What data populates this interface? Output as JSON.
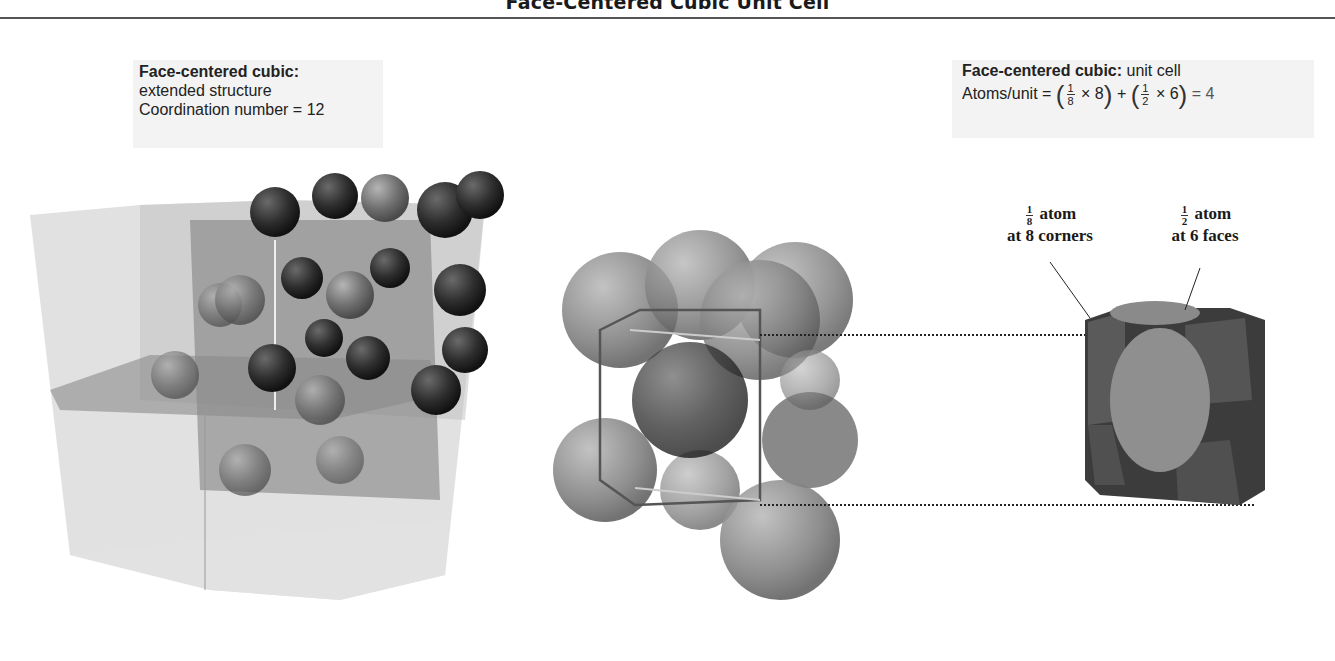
{
  "title": "Face-Centered Cubic Unit Cell",
  "left_caption": {
    "heading": "Face-centered cubic:",
    "line1": "extended structure",
    "line2": "Coordination number = 12"
  },
  "right_caption": {
    "heading": "Face-centered cubic:",
    "heading_suffix": " unit cell",
    "formula_prefix": "Atoms/unit = ",
    "frac1_num": "1",
    "frac1_den": "8",
    "times1": " × 8",
    "plus": " + ",
    "frac2_num": "1",
    "frac2_den": "2",
    "times2": " × 6",
    "result": " = 4"
  },
  "labels": {
    "corner": {
      "frac_num": "1",
      "frac_den": "8",
      "word": "atom",
      "line2": "at 8 corners"
    },
    "face": {
      "frac_num": "1",
      "frac_den": "2",
      "word": "atom",
      "line2": "at 6 faces"
    }
  },
  "colors": {
    "background": "#ffffff",
    "caption_bg": "#f3f3f3",
    "sphere_dark": "#2b2b2b",
    "sphere_mid": "#6e6e6e",
    "cube_glass": "#c8c8c8",
    "cell_face": "#999999"
  }
}
